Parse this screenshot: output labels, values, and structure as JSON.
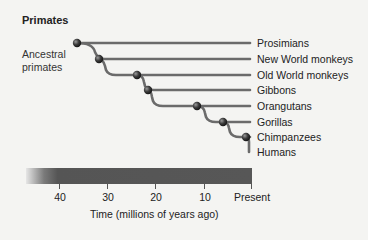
{
  "title": "Primates",
  "root_label": "Ancestral primates",
  "root_label_lines": [
    "Ancestral",
    "primates"
  ],
  "taxa": [
    "Prosimians",
    "New World monkeys",
    "Old World monkeys",
    "Gibbons",
    "Orangutans",
    "Gorillas",
    "Chimpanzees",
    "Humans"
  ],
  "divergence_nodes_mya": [
    {
      "split": "Prosimians",
      "approx_mya": 42
    },
    {
      "split": "New World monkeys",
      "approx_mya": 35
    },
    {
      "split": "Old World monkeys",
      "approx_mya": 24
    },
    {
      "split": "Gibbons",
      "approx_mya": 21
    },
    {
      "split": "Orangutans",
      "approx_mya": 12
    },
    {
      "split": "Gorillas",
      "approx_mya": 7
    },
    {
      "split": "Chimpanzees/Humans",
      "approx_mya": 1
    }
  ],
  "axis": {
    "ticks": [
      "40",
      "30",
      "20",
      "10",
      "Present"
    ],
    "title": "Time (millions of years ago)"
  },
  "colors": {
    "branch": "#6b6b6b",
    "node": "#3a3a3a",
    "background": "#f4f4f2"
  }
}
